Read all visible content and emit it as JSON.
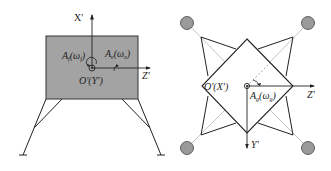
{
  "figure": {
    "left_panel": {
      "view": "side",
      "axis_x_label": "X'",
      "axis_z_label": "Z'",
      "origin_label": "O'(Y')",
      "annotation_f": {
        "main": "A",
        "sub": "f",
        "paren_open": "(ω",
        "paren_sub": "f",
        "paren_close": ")"
      },
      "annotation_e": {
        "main": "A",
        "sub": "e",
        "paren_open": "(ω",
        "paren_sub": "e",
        "paren_close": ")"
      }
    },
    "right_panel": {
      "view": "top",
      "axis_z_label": "Z'",
      "axis_y_label": "Y'",
      "origin_label": "O'(X')",
      "annotation_g": {
        "main": "A",
        "sub": "g",
        "paren_open": "(ω",
        "paren_sub": "g",
        "paren_close": ")"
      }
    },
    "colors": {
      "body_fill": "#a3a3a3",
      "line": "#222222",
      "foot_fill": "#9a9a9a",
      "thin_line": "#b5b5b5"
    }
  }
}
